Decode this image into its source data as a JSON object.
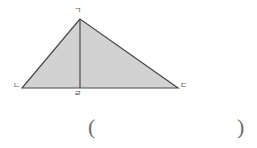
{
  "figure": {
    "kind": "geometry-triangle-with-altitude",
    "fill_color": "#d2d2d2",
    "stroke_color": "#4a4a4a",
    "background_color": "#ffffff",
    "label_color": "#555555",
    "vertices": {
      "apex": {
        "label": "ㄱ",
        "x": 80,
        "y": 19
      },
      "bottom_left": {
        "label": "ㄴ",
        "x": 22,
        "y": 88
      },
      "bottom_right": {
        "label": "ㄷ",
        "x": 178,
        "y": 88
      },
      "altitude_foot": {
        "label": "ㄹ",
        "x": 80,
        "y": 88
      }
    },
    "segments": [
      {
        "name": "side-apex-to-bottom-left",
        "from": "apex",
        "to": "bottom_left"
      },
      {
        "name": "side-apex-to-bottom-right",
        "from": "apex",
        "to": "bottom_right"
      },
      {
        "name": "base-bottom-left-to-bottom-right",
        "from": "bottom_left",
        "to": "bottom_right"
      },
      {
        "name": "altitude-apex-to-foot",
        "from": "apex",
        "to": "altitude_foot"
      }
    ]
  },
  "answer": {
    "open_paren": "(",
    "close_paren": ")",
    "value": ""
  }
}
